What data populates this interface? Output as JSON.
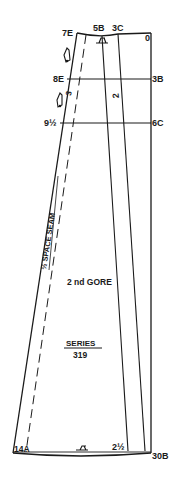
{
  "diagram": {
    "type": "sewing-pattern",
    "colors": {
      "ink": "#1a1a1a",
      "background": "#ffffff"
    },
    "points": {
      "top_left": "7E",
      "top_mid_1": "5B",
      "top_mid_2": "3C",
      "top_right": "0",
      "left_upper": "8E",
      "right_upper": "3B",
      "left_mid": "9½",
      "right_mid": "6C",
      "bottom_left": "14A",
      "bottom_mid": "2½",
      "bottom_right": "30B"
    },
    "panel_number": "2",
    "marker_number": "3",
    "seam_label": "½ SPACE SEAM",
    "piece_name": "2 nd GORE",
    "series_label": "SERIES",
    "series_number": "319"
  }
}
